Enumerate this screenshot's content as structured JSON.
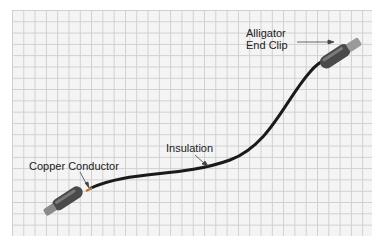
{
  "labels": {
    "clip": [
      "Alligator",
      "End Clip"
    ],
    "insulation": "Insulation",
    "conductor": "Copper Conductor"
  },
  "colors": {
    "wire": "#1a1a1a",
    "clip_body": "#555555",
    "grid": "#cfcfcf",
    "paper": "#f4f4f4"
  }
}
